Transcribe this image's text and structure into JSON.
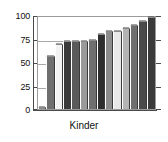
{
  "chart_data": {
    "type": "bar",
    "title": "",
    "xlabel": "Kinder",
    "ylabel": "",
    "ylim": [
      0,
      100
    ],
    "yticks": [
      0,
      25,
      50,
      75,
      100
    ],
    "ytick_labels": [
      "0",
      "25",
      "50",
      "75",
      "100"
    ],
    "grid": true,
    "legend": null,
    "categories": [
      "1",
      "2",
      "3",
      "4",
      "5",
      "6",
      "7",
      "8",
      "9",
      "10",
      "11",
      "12",
      "13",
      "14"
    ],
    "values": [
      2,
      58,
      71,
      74,
      74,
      74,
      75,
      82,
      85,
      85,
      88,
      91,
      96,
      100
    ],
    "bar_colors": [
      "#8c8c8c",
      "#6f6f6f",
      "#f2f2f2",
      "#3a3a3a",
      "#5a5a5a",
      "#9a9a9a",
      "#6f6f6f",
      "#2e2e2e",
      "#8c8c8c",
      "#e8e8e8",
      "#b4b4b4",
      "#6f6f6f",
      "#4a4a4a",
      "#3a3a3a"
    ]
  },
  "axis": {
    "y_tick_labels": [
      "100",
      "75",
      "50",
      "25",
      "0"
    ],
    "x_category_label": "Kinder"
  }
}
